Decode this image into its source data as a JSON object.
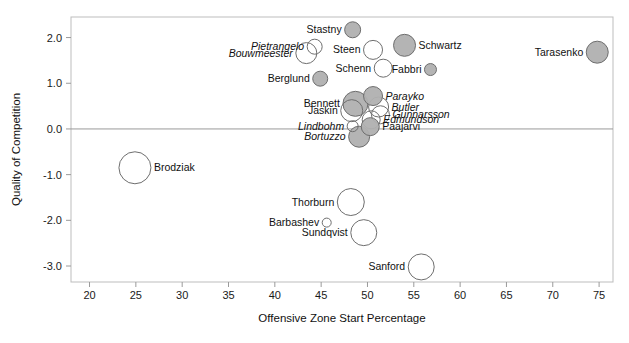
{
  "chart_data": {
    "type": "scatter",
    "title": "",
    "xlabel": "Offensive Zone Start Percentage",
    "ylabel": "Quality of Competition",
    "xlim": [
      18.0,
      76.5
    ],
    "ylim": [
      -3.35,
      2.45
    ],
    "xticks": [
      20,
      25,
      30,
      35,
      40,
      45,
      50,
      55,
      60,
      65,
      70,
      75
    ],
    "xtick_labels": [
      "20",
      "25",
      "30",
      "35",
      "40",
      "45",
      "50",
      "55",
      "60",
      "65",
      "70",
      "75"
    ],
    "yticks": [
      2.0,
      1.0,
      0.0,
      -1.0,
      -2.0,
      -3.0
    ],
    "ytick_labels": [
      "2.0",
      "1.0",
      "0.0",
      "-1.0",
      "-2.0",
      "-3.0"
    ],
    "grid": false,
    "zero_reference_line": true,
    "legend": "none",
    "size_encoding": "time-on-ice / usage (bubble area)",
    "fill_encoding": {
      "filled_gray": "forward",
      "open_white": "defenseman (italic label)"
    },
    "colors": {
      "bubble_fill": "#b0b0b0",
      "bubble_stroke": "#6e6e6e",
      "axis": "#9a9a9a",
      "text": "#111111",
      "background": "#ffffff"
    },
    "points": [
      {
        "name": "Stastny",
        "x": 48.4,
        "y": 2.17,
        "r": 8.0,
        "filled": true,
        "italic": false,
        "label_side": "left"
      },
      {
        "name": "Pietrangelo",
        "x": 44.3,
        "y": 1.8,
        "r": 7.5,
        "filled": false,
        "italic": true,
        "label_side": "left"
      },
      {
        "name": "Bouwmeester",
        "x": 43.4,
        "y": 1.66,
        "r": 10.5,
        "filled": false,
        "italic": true,
        "label_side": "left"
      },
      {
        "name": "Steen",
        "x": 50.6,
        "y": 1.73,
        "r": 9.5,
        "filled": false,
        "italic": false,
        "label_side": "left"
      },
      {
        "name": "Schwartz",
        "x": 54.0,
        "y": 1.83,
        "r": 11.0,
        "filled": true,
        "italic": false,
        "label_side": "right"
      },
      {
        "name": "Tarasenko",
        "x": 74.8,
        "y": 1.68,
        "r": 11.0,
        "filled": true,
        "italic": false,
        "label_side": "left"
      },
      {
        "name": "Berglund",
        "x": 44.9,
        "y": 1.1,
        "r": 7.5,
        "filled": true,
        "italic": false,
        "label_side": "left"
      },
      {
        "name": "Schenn",
        "x": 51.7,
        "y": 1.33,
        "r": 9.0,
        "filled": false,
        "italic": false,
        "label_side": "left"
      },
      {
        "name": "Fabbri",
        "x": 56.8,
        "y": 1.3,
        "r": 6.0,
        "filled": true,
        "italic": false,
        "label_side": "left"
      },
      {
        "name": "Parayko",
        "x": 50.6,
        "y": 0.72,
        "r": 9.5,
        "filled": true,
        "italic": true,
        "label_side": "right"
      },
      {
        "name": "Bennett",
        "x": 48.7,
        "y": 0.55,
        "r": 12.5,
        "filled": true,
        "italic": false,
        "label_side": "left"
      },
      {
        "name": "Butler",
        "x": 51.2,
        "y": 0.48,
        "r": 10.0,
        "filled": false,
        "italic": true,
        "label_side": "right"
      },
      {
        "name": "Jaskin",
        "x": 48.3,
        "y": 0.4,
        "r": 11.0,
        "filled": false,
        "italic": false,
        "label_side": "left"
      },
      {
        "name": "Gunnarsson",
        "x": 51.4,
        "y": 0.31,
        "r": 9.0,
        "filled": false,
        "italic": true,
        "label_side": "right"
      },
      {
        "name": "Edmundson",
        "x": 50.4,
        "y": 0.2,
        "r": 9.0,
        "filled": false,
        "italic": true,
        "label_side": "right"
      },
      {
        "name": "Lindbohm",
        "x": 48.4,
        "y": 0.06,
        "r": 5.5,
        "filled": false,
        "italic": true,
        "label_side": "left"
      },
      {
        "name": "Paajarvi",
        "x": 50.3,
        "y": 0.05,
        "r": 9.0,
        "filled": true,
        "italic": false,
        "label_side": "right"
      },
      {
        "name": "Bortuzzo",
        "x": 49.1,
        "y": -0.17,
        "r": 10.5,
        "filled": true,
        "italic": true,
        "label_side": "left"
      },
      {
        "name": "Brodziak",
        "x": 24.9,
        "y": -0.85,
        "r": 16.0,
        "filled": false,
        "italic": false,
        "label_side": "right"
      },
      {
        "name": "Thorburn",
        "x": 48.2,
        "y": -1.6,
        "r": 13.5,
        "filled": false,
        "italic": false,
        "label_side": "left"
      },
      {
        "name": "Barbashev",
        "x": 45.6,
        "y": -2.05,
        "r": 4.5,
        "filled": false,
        "italic": false,
        "label_side": "left"
      },
      {
        "name": "Sundqvist",
        "x": 49.6,
        "y": -2.27,
        "r": 13.0,
        "filled": false,
        "italic": false,
        "label_side": "left"
      },
      {
        "name": "Sanford",
        "x": 55.8,
        "y": -3.02,
        "r": 13.0,
        "filled": false,
        "italic": false,
        "label_side": "left"
      }
    ]
  }
}
